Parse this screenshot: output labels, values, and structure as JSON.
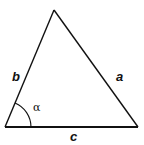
{
  "diagram": {
    "type": "triangle",
    "vertices": {
      "apex": [
        54,
        10
      ],
      "left": [
        5,
        127
      ],
      "right": [
        138,
        127
      ]
    },
    "sides": [
      {
        "id": "a",
        "label": "a",
        "from": "apex",
        "to": "right",
        "label_pos": [
          116,
          81
        ]
      },
      {
        "id": "b",
        "label": "b",
        "from": "left",
        "to": "apex",
        "label_pos": [
          12,
          81
        ]
      },
      {
        "id": "c",
        "label": "c",
        "from": "left",
        "to": "right",
        "label_pos": [
          70,
          141
        ]
      }
    ],
    "angle": {
      "label": "α",
      "vertex": "left",
      "radius": 26,
      "label_pos": [
        33,
        111
      ]
    },
    "colors": {
      "stroke": "#111111",
      "background": "#ffffff"
    }
  }
}
